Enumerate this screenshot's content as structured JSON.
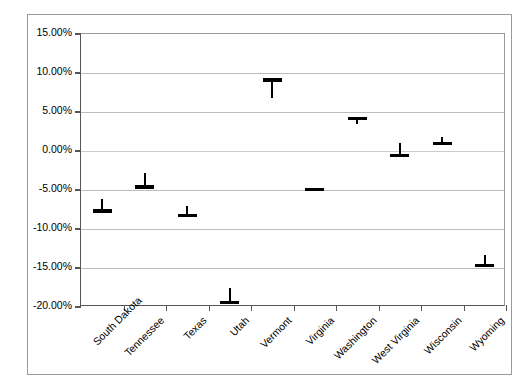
{
  "chart_data": {
    "type": "bar",
    "title": "",
    "subtitle": "",
    "xlabel": "",
    "ylabel": "",
    "categories": [
      "South Dakota",
      "Tennessee",
      "Texas",
      "Utah",
      "Vermont",
      "Virginia",
      "Washington",
      "West Virginia",
      "Wisconsin",
      "Wyoming"
    ],
    "values": [
      -7.7,
      -4.6,
      -8.3,
      -19.4,
      9.1,
      -4.9,
      4.2,
      -0.55,
      1.0,
      -14.7
    ],
    "series": [
      {
        "name": "Value",
        "values": [
          -7.7,
          -4.6,
          -8.3,
          -19.4,
          9.1,
          -4.9,
          4.2,
          -0.55,
          1.0,
          -14.7
        ]
      },
      {
        "name": "Whisker End",
        "values": [
          -6.2,
          -2.8,
          -7.0,
          -17.6,
          6.8,
          -4.9,
          3.4,
          1.0,
          1.8,
          -13.3
        ]
      }
    ],
    "points": [
      {
        "category": "South Dakota",
        "value": -7.7,
        "whisker_end": -6.2
      },
      {
        "category": "Tennessee",
        "value": -4.6,
        "whisker_end": -2.8
      },
      {
        "category": "Texas",
        "value": -8.3,
        "whisker_end": -7.0
      },
      {
        "category": "Utah",
        "value": -19.4,
        "whisker_end": -17.6
      },
      {
        "category": "Vermont",
        "value": 9.1,
        "whisker_end": 6.8
      },
      {
        "category": "Virginia",
        "value": -4.9,
        "whisker_end": -4.9
      },
      {
        "category": "Washington",
        "value": 4.2,
        "whisker_end": 3.4
      },
      {
        "category": "West Virginia",
        "value": -0.55,
        "whisker_end": 1.0
      },
      {
        "category": "Wisconsin",
        "value": 1.0,
        "whisker_end": 1.8
      },
      {
        "category": "Wyoming",
        "value": -14.7,
        "whisker_end": -13.3
      }
    ],
    "ylim": [
      -20,
      15
    ],
    "ytick_values": [
      15,
      10,
      5,
      0,
      -5,
      -10,
      -15,
      -20
    ],
    "ytick_labels": [
      "15.00%",
      "10.00%",
      "5.00%",
      "0.00%",
      "-5.00%",
      "-10.00%",
      "-15.00%",
      "-20.00%"
    ],
    "grid": true,
    "legend": "none",
    "colors": {
      "marker": "#000000",
      "gridline": "#bdbdbd",
      "axis": "#555555",
      "frame": "#9a9a9a",
      "background": "#ffffff",
      "text": "#000000"
    }
  }
}
